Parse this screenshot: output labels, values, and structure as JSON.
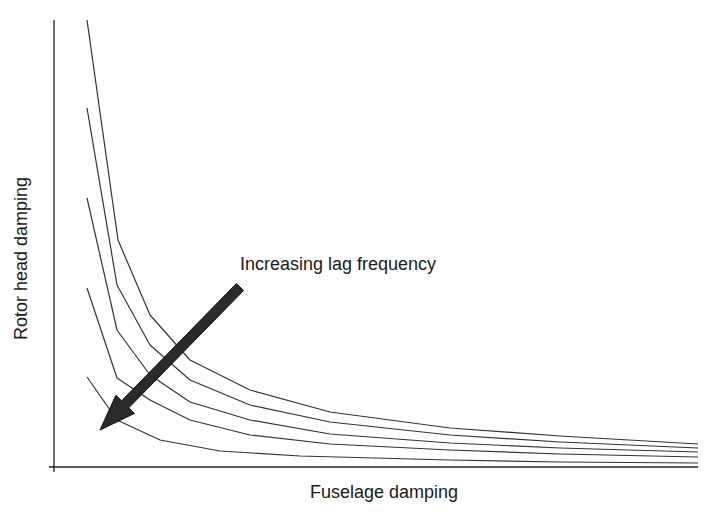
{
  "chart_data": {
    "type": "line",
    "title": "",
    "xlabel": "Fuselage damping",
    "ylabel": "Rotor head damping",
    "grid": false,
    "legend": null,
    "x_ticks": [],
    "y_ticks": [],
    "annotations": [
      {
        "text": "Increasing lag frequency",
        "kind": "arrow",
        "direction": "down-left",
        "from": [
          240,
          287
        ],
        "to": [
          100,
          430
        ]
      }
    ],
    "series": [
      {
        "name": "curve-1",
        "points": [
          [
            87,
            20
          ],
          [
            118,
            240
          ],
          [
            150,
            315
          ],
          [
            190,
            360
          ],
          [
            250,
            390
          ],
          [
            330,
            412
          ],
          [
            450,
            428
          ],
          [
            560,
            436
          ],
          [
            698,
            444
          ]
        ]
      },
      {
        "name": "curve-2",
        "points": [
          [
            87,
            108
          ],
          [
            117,
            285
          ],
          [
            150,
            345
          ],
          [
            190,
            380
          ],
          [
            250,
            405
          ],
          [
            330,
            422
          ],
          [
            450,
            435
          ],
          [
            560,
            442
          ],
          [
            698,
            448
          ]
        ]
      },
      {
        "name": "curve-3",
        "points": [
          [
            87,
            198
          ],
          [
            117,
            330
          ],
          [
            150,
            375
          ],
          [
            190,
            402
          ],
          [
            250,
            420
          ],
          [
            330,
            434
          ],
          [
            450,
            443
          ],
          [
            560,
            448
          ],
          [
            698,
            452
          ]
        ]
      },
      {
        "name": "curve-4",
        "points": [
          [
            87,
            288
          ],
          [
            117,
            378
          ],
          [
            150,
            400
          ],
          [
            190,
            420
          ],
          [
            250,
            435
          ],
          [
            330,
            444
          ],
          [
            450,
            450
          ],
          [
            560,
            454
          ],
          [
            698,
            457
          ]
        ]
      },
      {
        "name": "curve-5",
        "points": [
          [
            87,
            377
          ],
          [
            117,
            420
          ],
          [
            160,
            440
          ],
          [
            220,
            451
          ],
          [
            300,
            456
          ],
          [
            450,
            460
          ],
          [
            560,
            462
          ],
          [
            698,
            463
          ]
        ]
      }
    ],
    "axes": {
      "origin": [
        54,
        467
      ],
      "x_end": 698,
      "y_top": 20
    }
  },
  "labels": {
    "x": "Fuselage damping",
    "y": "Rotor head damping",
    "annotation": "Increasing lag frequency"
  }
}
